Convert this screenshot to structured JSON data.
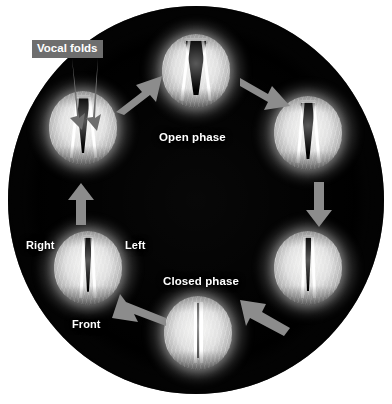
{
  "figure": {
    "name": "vocal-fold-vibration-cycle",
    "background_color": "#ffffff",
    "field_color": "#000000",
    "arrow_color": "#8c8c8c",
    "label_color": "#ffffff",
    "callout_background": "#6e6e6e"
  },
  "callouts": [
    {
      "id": "vocal-folds",
      "text": "Vocal folds"
    }
  ],
  "phase_labels": [
    {
      "id": "open-phase",
      "text": "Open phase"
    },
    {
      "id": "closed-phase",
      "text": "Closed phase"
    }
  ],
  "orientation_labels": [
    {
      "id": "right",
      "text": "Right"
    },
    {
      "id": "left",
      "text": "Left"
    },
    {
      "id": "front",
      "text": "Front"
    }
  ],
  "frames": [
    {
      "id": "frame-top",
      "position": "top",
      "phase": "open",
      "aperture_open": "wide"
    },
    {
      "id": "frame-upper-right",
      "position": "upper-right",
      "phase": "closing",
      "aperture_open": "medium"
    },
    {
      "id": "frame-lower-right",
      "position": "lower-right",
      "phase": "closing",
      "aperture_open": "narrow"
    },
    {
      "id": "frame-bottom",
      "position": "bottom",
      "phase": "closed",
      "aperture_open": "none"
    },
    {
      "id": "frame-lower-left",
      "position": "lower-left",
      "phase": "opening",
      "aperture_open": "narrow"
    },
    {
      "id": "frame-upper-left",
      "position": "upper-left",
      "phase": "opening",
      "aperture_open": "medium"
    }
  ],
  "arrows": [
    {
      "id": "arrow-upper-left-to-top",
      "direction": "up-right"
    },
    {
      "id": "arrow-top-to-upper-right",
      "direction": "down-right"
    },
    {
      "id": "arrow-upper-right-to-lower-right",
      "direction": "down"
    },
    {
      "id": "arrow-lower-right-to-bottom",
      "direction": "down-left"
    },
    {
      "id": "arrow-bottom-to-lower-left",
      "direction": "up-left"
    },
    {
      "id": "arrow-lower-left-to-upper-left",
      "direction": "up"
    }
  ]
}
